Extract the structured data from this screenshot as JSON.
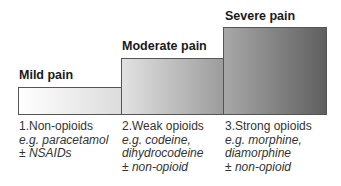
{
  "diagram": {
    "type": "analgesic ladder",
    "steps": [
      {
        "level": "Mild pain",
        "drug_class": "1.Non-opioids",
        "lines": [
          "e.g. paracetamol",
          "± NSAIDs"
        ]
      },
      {
        "level": "Moderate pain",
        "drug_class": "2.Weak opioids",
        "lines": [
          "e.g. codeine,",
          "dihydrocodeine",
          "± non-opioid"
        ]
      },
      {
        "level": "Severe pain",
        "drug_class": "3.Strong opioids",
        "lines": [
          "e.g. morphine,",
          "diamorphine",
          "± non-opioid"
        ]
      }
    ]
  }
}
